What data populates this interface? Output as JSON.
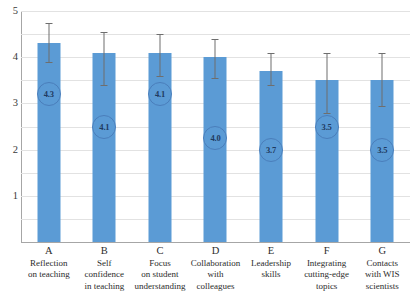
{
  "chart_data": {
    "type": "bar",
    "title": "",
    "subtitle": "",
    "xlabel": "",
    "ylabel": "",
    "ylim": [
      0,
      5
    ],
    "yticks": [
      1,
      2,
      3,
      4,
      5
    ],
    "ytick_labels": [
      "1",
      "2",
      "3",
      "4",
      "5"
    ],
    "gridlines": [
      0.5,
      1,
      1.5,
      2,
      2.5,
      3,
      3.5,
      4,
      4.5,
      5
    ],
    "grid": true,
    "legend": false,
    "legend_position": "none",
    "bar_color": "#5b9bd5",
    "errorbar_color": "#6e6e6e",
    "bubble_outline_color": "#4a7ebb",
    "bubble_text_color": "#1f3a5f",
    "gridline_color": "#e2e2e2",
    "axis_color": "#a6a6a6",
    "categories": [
      "A",
      "B",
      "C",
      "D",
      "E",
      "F",
      "G"
    ],
    "category_descriptions": [
      "Reflection\non teaching",
      "Self\nconfidence\nin teaching",
      "Focus\non student\nunderstanding",
      "Collaboration\nwith\ncolleagues",
      "Leadership\nskills",
      "Integrating\ncutting-edge\ntopics",
      "Contacts\nwith WIS\nscientists"
    ],
    "values": [
      4.3,
      4.1,
      4.1,
      4.0,
      3.7,
      3.5,
      3.5
    ],
    "value_labels": [
      "4.3",
      "4.1",
      "4.1",
      "4.0",
      "3.7",
      "3.5",
      "3.5"
    ],
    "error_upper": [
      4.75,
      4.55,
      4.5,
      4.4,
      4.1,
      4.1,
      4.1
    ],
    "error_lower": [
      3.9,
      3.4,
      3.6,
      3.55,
      3.4,
      2.8,
      2.95
    ],
    "label_positions": [
      3.2,
      2.5,
      3.2,
      2.25,
      2.0,
      2.5,
      2.0
    ]
  },
  "bars": [
    {
      "key": "A",
      "desc_lines": [
        "Reflection",
        "on teaching"
      ],
      "value_label": "4.3"
    },
    {
      "key": "B",
      "desc_lines": [
        "Self",
        "confidence",
        "in teaching"
      ],
      "value_label": "4.1"
    },
    {
      "key": "C",
      "desc_lines": [
        "Focus",
        "on student",
        "understanding"
      ],
      "value_label": "4.1"
    },
    {
      "key": "D",
      "desc_lines": [
        "Collaboration",
        "with",
        "colleagues"
      ],
      "value_label": "4.0"
    },
    {
      "key": "E",
      "desc_lines": [
        "Leadership",
        "skills"
      ],
      "value_label": "3.7"
    },
    {
      "key": "F",
      "desc_lines": [
        "Integrating",
        "cutting-edge",
        "topics"
      ],
      "value_label": "3.5"
    },
    {
      "key": "G",
      "desc_lines": [
        "Contacts",
        "with WIS",
        "scientists"
      ],
      "value_label": "3.5"
    }
  ]
}
